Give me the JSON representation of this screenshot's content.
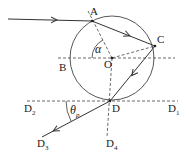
{
  "diagram": {
    "labels": {
      "A": "A",
      "B": "B",
      "C": "C",
      "O": "O",
      "D": "D",
      "alpha": "α",
      "theta": "θ",
      "theta_sub": "p",
      "D1": "D",
      "D1_sub": "1",
      "D2": "D",
      "D2_sub": "2",
      "D3": "D",
      "D3_sub": "3",
      "D4": "D",
      "D4_sub": "4"
    },
    "colors": {
      "line": "#333333",
      "background": "#ffffff"
    }
  }
}
